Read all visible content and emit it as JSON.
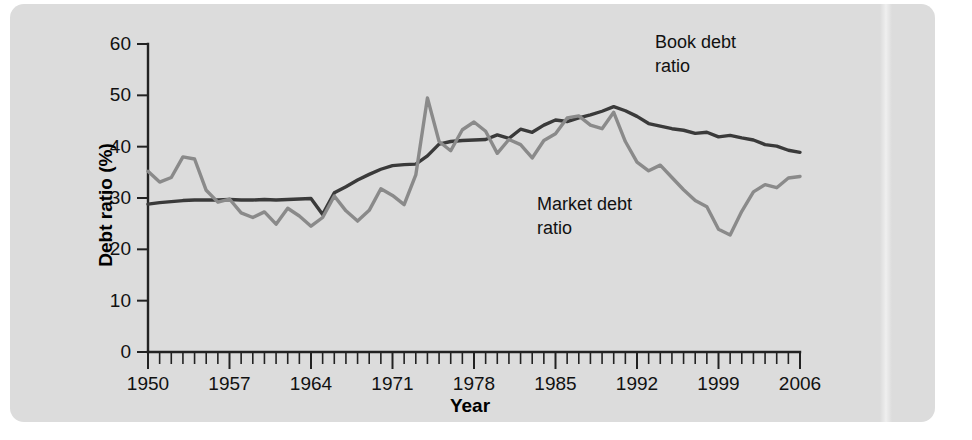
{
  "figure": {
    "panel_background": "#dcdcdc",
    "page_background": "#ffffff"
  },
  "chart_data": {
    "type": "line",
    "title": "",
    "xlabel": "Year",
    "ylabel": "Debt ratio (%)",
    "xlim": [
      1950,
      2006
    ],
    "ylim": [
      0,
      60
    ],
    "ytick_labels": [
      "0",
      "10",
      "20",
      "30",
      "40",
      "50",
      "60"
    ],
    "ytick_values": [
      0,
      10,
      20,
      30,
      40,
      50,
      60
    ],
    "xtick_labels": [
      "1950",
      "1957",
      "1964",
      "1971",
      "1978",
      "1985",
      "1992",
      "1999",
      "2006"
    ],
    "xtick_values": [
      1950,
      1957,
      1964,
      1971,
      1978,
      1985,
      1992,
      1999,
      2006
    ],
    "minor_xticks_every": 1,
    "grid": false,
    "legend_position": "inline-annotation",
    "x": [
      1950,
      1951,
      1952,
      1953,
      1954,
      1955,
      1956,
      1957,
      1958,
      1959,
      1960,
      1961,
      1962,
      1963,
      1964,
      1965,
      1966,
      1967,
      1968,
      1969,
      1970,
      1971,
      1972,
      1973,
      1974,
      1975,
      1976,
      1977,
      1978,
      1979,
      1980,
      1981,
      1982,
      1983,
      1984,
      1985,
      1986,
      1987,
      1988,
      1989,
      1990,
      1991,
      1992,
      1993,
      1994,
      1995,
      1996,
      1997,
      1998,
      1999,
      2000,
      2001,
      2002,
      2003,
      2004,
      2005,
      2006
    ],
    "series": [
      {
        "name": "Book debt ratio",
        "color": "#3a3a3a",
        "annotation_text": "Book debt\nratio",
        "values": [
          28.8,
          29.1,
          29.3,
          29.5,
          29.6,
          29.6,
          29.6,
          29.7,
          29.6,
          29.6,
          29.7,
          29.6,
          29.7,
          29.8,
          29.9,
          26.8,
          31.0,
          32.2,
          33.5,
          34.6,
          35.6,
          36.3,
          36.5,
          36.6,
          38.2,
          40.5,
          41.0,
          41.2,
          41.3,
          41.4,
          42.3,
          41.6,
          43.4,
          42.8,
          44.2,
          45.2,
          44.9,
          45.6,
          46.2,
          46.9,
          47.8,
          47.0,
          45.9,
          44.5,
          44.0,
          43.5,
          43.2,
          42.6,
          42.8,
          41.9,
          42.2,
          41.7,
          41.3,
          40.4,
          40.1,
          39.3,
          38.9
        ]
      },
      {
        "name": "Market debt ratio",
        "color": "#8a8a8a",
        "annotation_text": "Market debt\nratio",
        "values": [
          35.2,
          33.1,
          34.0,
          38.0,
          37.6,
          31.5,
          29.2,
          29.8,
          27.1,
          26.2,
          27.3,
          24.9,
          28.0,
          26.5,
          24.5,
          26.2,
          30.4,
          27.5,
          25.5,
          27.6,
          31.8,
          30.5,
          28.7,
          34.5,
          49.5,
          41.0,
          39.2,
          43.3,
          44.8,
          43.0,
          38.7,
          41.4,
          40.4,
          37.8,
          41.2,
          42.5,
          45.6,
          46.0,
          44.2,
          43.5,
          46.7,
          41.0,
          37.0,
          35.3,
          36.4,
          34.0,
          31.6,
          29.5,
          28.3,
          23.9,
          22.8,
          27.4,
          31.2,
          32.6,
          32.0,
          33.9,
          34.2
        ]
      }
    ]
  },
  "annotations": {
    "book": {
      "line1": "Book debt",
      "line2": "ratio"
    },
    "market": {
      "line1": "Market debt",
      "line2": "ratio"
    }
  }
}
